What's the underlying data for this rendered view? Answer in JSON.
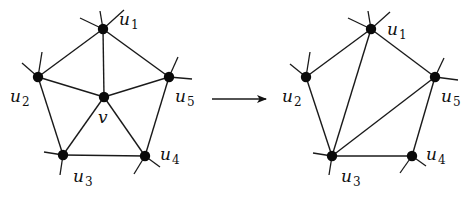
{
  "diagram": {
    "type": "graph-transformation",
    "colors": {
      "ink": "#111111",
      "background": "#ffffff"
    },
    "left_graph": {
      "name": "before",
      "nodes": [
        {
          "id": "u1",
          "label": "u",
          "sub": "1",
          "x": 103,
          "y": 29,
          "lx": 119,
          "ly": 25
        },
        {
          "id": "u2",
          "label": "u",
          "sub": "2",
          "x": 38,
          "y": 77,
          "lx": 10,
          "ly": 102
        },
        {
          "id": "u3",
          "label": "u",
          "sub": "3",
          "x": 63,
          "y": 155,
          "lx": 73,
          "ly": 182
        },
        {
          "id": "u4",
          "label": "u",
          "sub": "4",
          "x": 145,
          "y": 156,
          "lx": 160,
          "ly": 160
        },
        {
          "id": "u5",
          "label": "u",
          "sub": "5",
          "x": 169,
          "y": 77,
          "lx": 175,
          "ly": 102
        },
        {
          "id": "v",
          "label": "v",
          "sub": "",
          "x": 104,
          "y": 97,
          "lx": 98,
          "ly": 123
        }
      ],
      "edges": [
        [
          "u1",
          "u2"
        ],
        [
          "u2",
          "u3"
        ],
        [
          "u3",
          "u4"
        ],
        [
          "u4",
          "u5"
        ],
        [
          "u5",
          "u1"
        ],
        [
          "v",
          "u1"
        ],
        [
          "v",
          "u2"
        ],
        [
          "v",
          "u3"
        ],
        [
          "v",
          "u4"
        ],
        [
          "v",
          "u5"
        ]
      ],
      "stubs": [
        [
          103,
          29,
          80,
          18
        ],
        [
          103,
          29,
          100,
          11
        ],
        [
          103,
          29,
          124,
          10
        ],
        [
          38,
          77,
          22,
          63
        ],
        [
          38,
          77,
          42,
          52
        ],
        [
          169,
          77,
          178,
          57
        ],
        [
          169,
          77,
          192,
          79
        ],
        [
          63,
          155,
          44,
          152
        ],
        [
          63,
          155,
          60,
          175
        ],
        [
          145,
          156,
          134,
          174
        ],
        [
          145,
          156,
          160,
          167
        ]
      ]
    },
    "arrow": {
      "x1": 212,
      "y1": 99,
      "x2": 266,
      "y2": 99,
      "symbol": "→"
    },
    "right_graph": {
      "name": "after",
      "nodes": [
        {
          "id": "u1",
          "label": "u",
          "sub": "1",
          "x": 371,
          "y": 29,
          "lx": 387,
          "ly": 35
        },
        {
          "id": "u2",
          "label": "u",
          "sub": "2",
          "x": 306,
          "y": 77,
          "lx": 282,
          "ly": 102
        },
        {
          "id": "u3",
          "label": "u",
          "sub": "3",
          "x": 332,
          "y": 156,
          "lx": 341,
          "ly": 182
        },
        {
          "id": "u4",
          "label": "u",
          "sub": "4",
          "x": 412,
          "y": 156,
          "lx": 426,
          "ly": 160
        },
        {
          "id": "u5",
          "label": "u",
          "sub": "5",
          "x": 435,
          "y": 77,
          "lx": 441,
          "ly": 102
        }
      ],
      "edges": [
        [
          "u1",
          "u2"
        ],
        [
          "u2",
          "u3"
        ],
        [
          "u3",
          "u4"
        ],
        [
          "u4",
          "u5"
        ],
        [
          "u5",
          "u1"
        ],
        [
          "u3",
          "u1"
        ],
        [
          "u3",
          "u5"
        ]
      ],
      "stubs": [
        [
          371,
          29,
          348,
          18
        ],
        [
          371,
          29,
          368,
          11
        ],
        [
          371,
          29,
          390,
          12
        ],
        [
          306,
          77,
          290,
          64
        ],
        [
          306,
          77,
          310,
          52
        ],
        [
          435,
          77,
          444,
          58
        ],
        [
          435,
          77,
          458,
          80
        ],
        [
          332,
          156,
          313,
          153
        ],
        [
          332,
          156,
          329,
          175
        ],
        [
          412,
          156,
          400,
          173
        ],
        [
          412,
          156,
          426,
          166
        ]
      ]
    }
  }
}
